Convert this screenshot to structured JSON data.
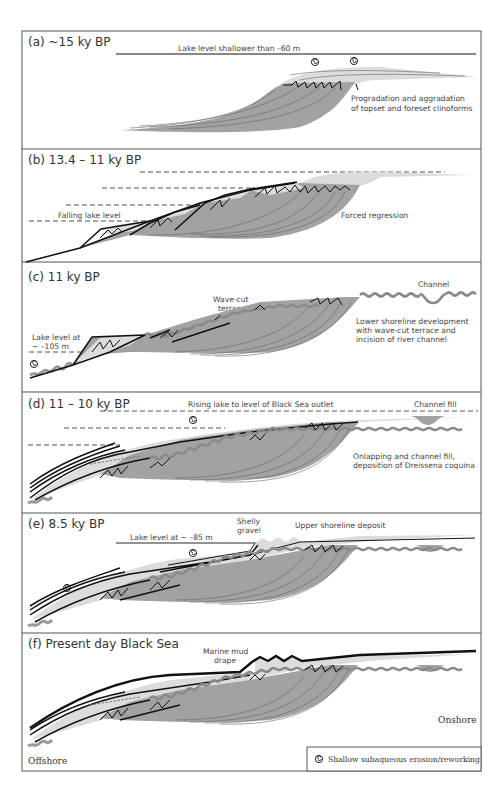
{
  "figure": {
    "panels": [
      {
        "id": "a",
        "label": "(a)  ~15 ky BP",
        "annotations": [
          "Lake level shallower than –60 m",
          "Progradation and aggradation",
          "of topset and foreset clinoforms"
        ]
      },
      {
        "id": "b",
        "label": "(b)  13.4 – 11 ky BP",
        "annotations": [
          "Falling lake level",
          "Forced regression"
        ]
      },
      {
        "id": "c",
        "label": "(c)  11 ky BP",
        "annotations": [
          "Wave-cut",
          "terrace",
          "Channel",
          "Lake level at",
          "~ –105 m",
          "Lower shoreline development",
          "with wave-cut terrace and",
          "incision of river channel"
        ]
      },
      {
        "id": "d",
        "label": "(d)  11 – 10 ky BP",
        "annotations": [
          "Rising lake to level of Black Sea outlet",
          "Channel fill",
          "Onlapping and channel fill,",
          "deposition of Dreissena coquina"
        ]
      },
      {
        "id": "e",
        "label": "(e)  8.5 ky BP",
        "annotations": [
          "Shelly",
          "gravel",
          "Upper shoreline deposit",
          "Lake level at ~ –85 m"
        ]
      },
      {
        "id": "f",
        "label": "(f)  Present day Black Sea",
        "annotations": [
          "Marine mud",
          "drape",
          "Onshore",
          "Offshore"
        ]
      }
    ],
    "legend": {
      "symbol": "◎",
      "text": "Shallow subaqueous erosion/reworking"
    },
    "colors": {
      "dark_fill": "#a2a2a2",
      "light_fill": "#dcdcdc",
      "erosion": "#8a8a8a",
      "line": "#111111",
      "border": "#555555"
    }
  }
}
